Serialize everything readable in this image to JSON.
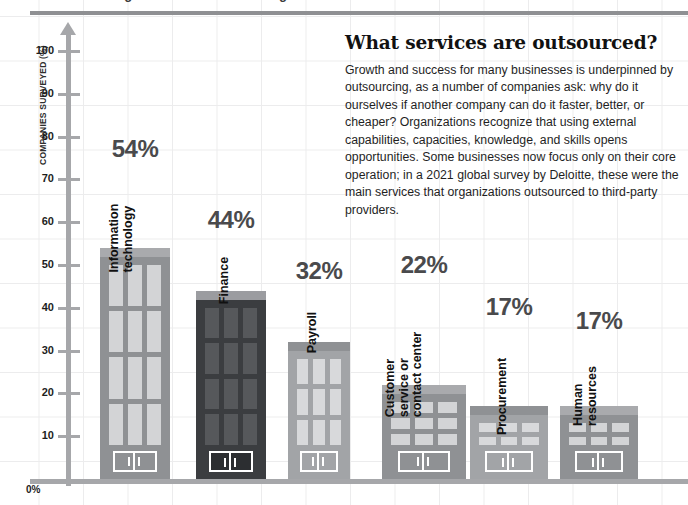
{
  "top_strip": {
    "clipped_text": "Outsourcing: what services are being outsourced?"
  },
  "chart_data": {
    "type": "bar",
    "title": "What services are outsourced?",
    "xlabel": "",
    "ylabel": "COMPANIES SURVEYED (%)",
    "ylim": [
      0,
      105
    ],
    "grid": true,
    "legend": "none",
    "categories": [
      "Information technology",
      "Finance",
      "Payroll",
      "Customer service or contact center",
      "Procurement",
      "Human resources"
    ],
    "values": [
      54,
      44,
      32,
      22,
      17,
      17
    ],
    "value_labels": [
      "54%",
      "44%",
      "32%",
      "22%",
      "17%",
      "17%"
    ],
    "ytick_labels": [
      "100",
      "90",
      "80",
      "70",
      "60",
      "50",
      "40",
      "30",
      "20",
      "10"
    ],
    "ytick_values": [
      100,
      90,
      80,
      70,
      60,
      50,
      40,
      30,
      20,
      10
    ],
    "zero_label": "0%",
    "source_note": "2021 global survey by Deloitte"
  },
  "bars": [
    {
      "label": "Information technology",
      "label_lines": [
        "Information",
        "technology"
      ],
      "value_label": "54%",
      "value": 54,
      "fill": "#8f9194",
      "roof": "#a9aaad",
      "window": "#d3d4d6",
      "window_cols": 3,
      "window_rows": 4,
      "door_fill": "#8f9194"
    },
    {
      "label": "Finance",
      "label_lines": [
        "Finance"
      ],
      "value_label": "44%",
      "value": 44,
      "fill": "#3b3d40",
      "roof": "#9b9ca0",
      "window": "#56585b",
      "window_cols": 3,
      "window_rows": 4,
      "door_fill": "#2c2e31"
    },
    {
      "label": "Payroll",
      "label_lines": [
        "Payroll"
      ],
      "value_label": "32%",
      "value": 32,
      "fill": "#a2a4a7",
      "roof": "#8f9194",
      "window": "#d8d9db",
      "window_cols": 3,
      "window_rows": 3,
      "door_fill": "#a2a4a7"
    },
    {
      "label": "Customer service or contact center",
      "label_lines": [
        "Customer",
        "service or",
        "contact center"
      ],
      "value_label": "22%",
      "value": 22,
      "fill": "#8f9194",
      "roof": "#a9aaad",
      "window": "#d3d4d6",
      "window_cols": 3,
      "window_rows": 3,
      "door_fill": "#8f9194"
    },
    {
      "label": "Procurement",
      "label_lines": [
        "Procurement"
      ],
      "value_label": "17%",
      "value": 17,
      "fill": "#a2a4a7",
      "roof": "#8f9194",
      "window": "#d8d9db",
      "window_cols": 3,
      "window_rows": 2,
      "door_fill": "#a2a4a7"
    },
    {
      "label": "Human resources",
      "label_lines": [
        "Human",
        "resources"
      ],
      "value_label": "17%",
      "value": 17,
      "fill": "#8f9194",
      "roof": "#a9aaad",
      "window": "#d3d4d6",
      "window_cols": 3,
      "window_rows": 2,
      "door_fill": "#8f9194"
    }
  ],
  "copy": {
    "headline": "What services are outsourced?",
    "body": "Growth and success for many businesses is underpinned by outsourcing, as a number of companies ask: why do it ourselves if another company can do it faster, better, or cheaper? Organizations recognize that using external capabilities, capacities, knowledge, and skills opens opportunities. Some businesses now focus only on their core operation; in a 2021 global survey by Deloitte, these were the main services that organizations outsourced to third-party providers."
  },
  "colors": {
    "axis": "#a6a7aa",
    "grid": "#ececed",
    "value_text": "#4a4a4c",
    "category_text": "#111111",
    "rule": "#8f9093"
  }
}
